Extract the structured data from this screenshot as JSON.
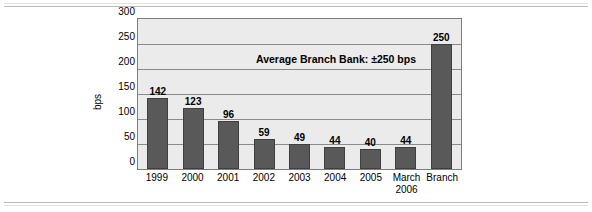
{
  "page": {
    "background_color": "#ffffff",
    "rule_color": "#b9b9b9"
  },
  "chart_data": {
    "type": "bar",
    "title": "",
    "xlabel": "",
    "ylabel": "bps",
    "categories": [
      "1999",
      "2000",
      "2001",
      "2002",
      "2003",
      "2004",
      "2005",
      "March 2006",
      "Branch"
    ],
    "category_lines": [
      [
        "1999"
      ],
      [
        "2000"
      ],
      [
        "2001"
      ],
      [
        "2002"
      ],
      [
        "2003"
      ],
      [
        "2004"
      ],
      [
        "2005"
      ],
      [
        "March",
        "2006"
      ],
      [
        "Branch"
      ]
    ],
    "values": [
      142,
      123,
      96,
      59,
      49,
      44,
      40,
      44,
      250
    ],
    "value_labels": [
      "142",
      "123",
      "96",
      "59",
      "49",
      "44",
      "40",
      "44",
      "250"
    ],
    "ylim": [
      0,
      300
    ],
    "yticks": [
      300,
      250,
      200,
      150,
      100,
      50,
      0
    ],
    "ytick_labels": [
      "300",
      "250",
      "200",
      "150",
      "100",
      "50",
      "0"
    ],
    "grid": true,
    "grid_axis": "y",
    "legend": null,
    "annotations": [
      {
        "text": "Average Branch Bank: ±250 bps",
        "x_value": "2002-2005",
        "y_value": 225
      }
    ],
    "bar_color": "#595959",
    "bar_edge_color": "#3f3f3f",
    "plot_background": "#ebebeb",
    "plot_border_color": "#7d7d7d"
  }
}
